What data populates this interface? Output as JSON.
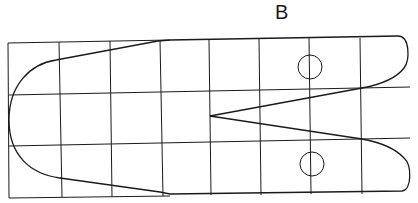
{
  "diagram": {
    "label": "B",
    "stroke_color": "#1a1a1a",
    "grid": {
      "columns": 8,
      "rows": 3
    },
    "circles": 2,
    "notch": "V-shaped"
  }
}
